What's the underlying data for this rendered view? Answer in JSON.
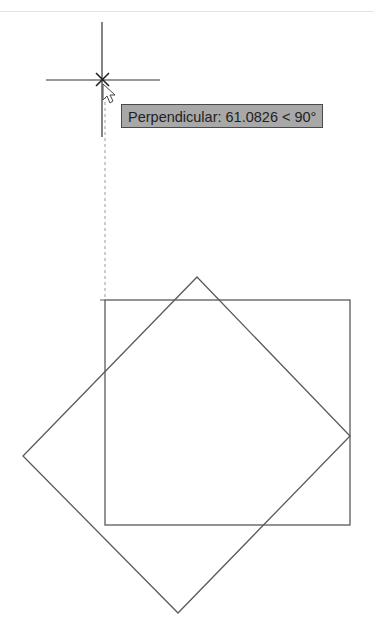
{
  "tooltip": {
    "label": "Perpendicular",
    "text": "Perpendicular: 61.0826 < 90°",
    "distance": "61.0826",
    "angle": "90°"
  },
  "cursor": {
    "type": "crosshair",
    "snap_marker": "perpendicular-x",
    "position": [
      102,
      80
    ]
  },
  "colors": {
    "background": "#ffffff",
    "geometry": "#5a5a5a",
    "tooltip_bg": "#a8a8a8",
    "tooltip_border": "#4a4a4a",
    "tracking_line": "#9a9a9a"
  },
  "drawing": {
    "rectangle": {
      "x1": 105,
      "y1": 300,
      "x2": 350,
      "y2": 525
    },
    "diamond": {
      "top": [
        197,
        277
      ],
      "right": [
        350,
        436
      ],
      "bottom": [
        178,
        613
      ],
      "left": [
        23,
        456
      ]
    },
    "tracking_line": {
      "x": 105,
      "y1": 88,
      "y2": 300
    }
  }
}
